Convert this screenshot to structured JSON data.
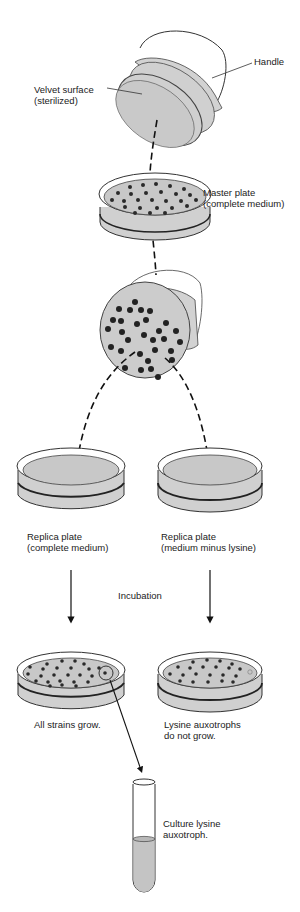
{
  "diagram": {
    "type": "replica-plating-procedure",
    "colors": {
      "medium": "#c8c8c8",
      "colony": "#2a2a2a",
      "outline": "#333333",
      "rim": "#ffffff"
    },
    "velvet_block": {
      "surface_label_line1": "Velvet surface",
      "surface_label_line2": "(sterilized)",
      "handle_label": "Handle"
    },
    "master_plate": {
      "label_line1": "Master plate",
      "label_line2": "(complete medium)"
    },
    "replica_left": {
      "label_line1": "Replica plate",
      "label_line2": "(complete medium)"
    },
    "replica_right": {
      "label_line1": "Replica plate",
      "label_line2": "(medium minus lysine)"
    },
    "incubation_label": "Incubation",
    "result_left": {
      "label": "All strains grow."
    },
    "result_right": {
      "label_line1": "Lysine auxotrophs",
      "label_line2": "do not grow."
    },
    "test_tube": {
      "label_line1": "Culture lysine",
      "label_line2": "auxotroph."
    }
  }
}
